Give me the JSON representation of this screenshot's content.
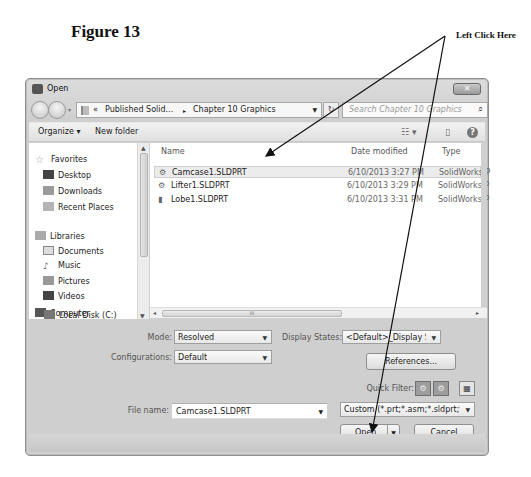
{
  "figure": {
    "title": "Figure 13",
    "callout": "Left Click Here"
  },
  "dialog": {
    "title": "Open",
    "close_label": "✕",
    "nav": {
      "back_icon": "back-arrow",
      "forward_icon": "forward-arrow",
      "breadcrumb": [
        "«",
        "Published Solid...",
        "▸",
        "Chapter 10 Graphics"
      ],
      "refresh_label": "↻",
      "search_placeholder": "Search Chapter 10 Graphics",
      "search_icon": "⌕"
    },
    "toolbar": {
      "organize_label": "Organize ▾",
      "new_folder_label": "New folder",
      "views_icon": "☷ ▾",
      "preview_icon": "▯",
      "help_label": "?"
    },
    "sidebar": {
      "groups": [
        {
          "label": "Favorites",
          "items": [
            "Desktop",
            "Downloads",
            "Recent Places"
          ]
        },
        {
          "label": "Libraries",
          "items": [
            "Documents",
            "Music",
            "Pictures",
            "Videos"
          ]
        },
        {
          "label": "Computer",
          "items": [
            "Local Disk (C:)"
          ]
        }
      ]
    },
    "file_list": {
      "columns": [
        "Name",
        "Date modified",
        "Type"
      ],
      "rows": [
        {
          "name": "Camcase1.SLDPRT",
          "date": "6/10/2013 3:27 PM",
          "type": "SolidWorks P",
          "selected": true
        },
        {
          "name": "Lifter1.SLDPRT",
          "date": "6/10/2013 3:29 PM",
          "type": "SolidWorks P",
          "selected": false
        },
        {
          "name": "Lobe1.SLDPRT",
          "date": "6/10/2013 3:31 PM",
          "type": "SolidWorks P",
          "selected": false
        }
      ],
      "scroll_grip": "III"
    },
    "options": {
      "mode_label": "Mode:",
      "mode_value": "Resolved",
      "configurations_label": "Configurations:",
      "configurations_value": "Default",
      "display_states_label": "Display States:",
      "display_states_value": "<Default>_Display St",
      "references_label": "References...",
      "quick_filter_label": "Quick Filter:"
    },
    "footer": {
      "file_name_label": "File name:",
      "file_name_value": "Camcase1.SLDPRT",
      "file_type_value": "Custom (*.prt;*.asm;*.sldprt;*.sl",
      "open_label": "Open",
      "cancel_label": "Cancel"
    }
  }
}
